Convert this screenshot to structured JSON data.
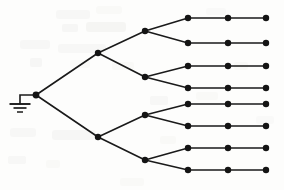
{
  "diagram": {
    "type": "node-link-tree",
    "width": 284,
    "height": 190,
    "background_color": "#fdfdfc",
    "stroke_color": "#1a1a1a",
    "node_fill_color": "#141414",
    "edge_width": 1.6,
    "node_radius": 3.2,
    "root_node_radius": 3.4,
    "ground_symbol": {
      "name": "earth-ground",
      "stem_from_x": 36,
      "stem_from_y": 95,
      "corner_x": 20,
      "corner_y": 95,
      "stem_x": 20,
      "stem_top_y": 95,
      "stem_bottom_y": 104,
      "bars": [
        {
          "half_width": 10.5,
          "y": 104,
          "thickness": 1.9
        },
        {
          "half_width": 6.5,
          "y": 108,
          "thickness": 1.7
        },
        {
          "half_width": 3.0,
          "y": 112,
          "thickness": 1.5
        }
      ]
    },
    "levels": [
      {
        "name": "root",
        "depth": 0,
        "x": 36,
        "count": 1
      },
      {
        "name": "level-1",
        "depth": 1,
        "x": 98,
        "count": 2
      },
      {
        "name": "level-2",
        "depth": 2,
        "x": 145,
        "count": 4
      },
      {
        "name": "leaf-a",
        "depth": 3,
        "x": 188,
        "count": 8
      },
      {
        "name": "leaf-b",
        "depth": 4,
        "x": 228,
        "count": 8
      },
      {
        "name": "leaf-c",
        "depth": 5,
        "x": 266,
        "count": 8
      }
    ],
    "nodes": [
      {
        "id": "root",
        "label": "root",
        "x": 36,
        "y": 95,
        "level": 0
      },
      {
        "id": "n1a",
        "label": "upper-branch",
        "x": 98,
        "y": 53,
        "level": 1
      },
      {
        "id": "n1b",
        "label": "lower-branch",
        "x": 98,
        "y": 137,
        "level": 1
      },
      {
        "id": "n2a",
        "label": "branch-1",
        "x": 145,
        "y": 31,
        "level": 2
      },
      {
        "id": "n2b",
        "label": "branch-2",
        "x": 145,
        "y": 77,
        "level": 2
      },
      {
        "id": "n2c",
        "label": "branch-3",
        "x": 145,
        "y": 115,
        "level": 2
      },
      {
        "id": "n2d",
        "label": "branch-4",
        "x": 145,
        "y": 160,
        "level": 2
      },
      {
        "id": "l1a",
        "label": "leaf-1-a",
        "x": 188,
        "y": 18,
        "level": 3
      },
      {
        "id": "l2a",
        "label": "leaf-2-a",
        "x": 188,
        "y": 43,
        "level": 3
      },
      {
        "id": "l3a",
        "label": "leaf-3-a",
        "x": 188,
        "y": 66,
        "level": 3
      },
      {
        "id": "l4a",
        "label": "leaf-4-a",
        "x": 188,
        "y": 88,
        "level": 3
      },
      {
        "id": "l5a",
        "label": "leaf-5-a",
        "x": 188,
        "y": 104,
        "level": 3
      },
      {
        "id": "l6a",
        "label": "leaf-6-a",
        "x": 188,
        "y": 126,
        "level": 3
      },
      {
        "id": "l7a",
        "label": "leaf-7-a",
        "x": 188,
        "y": 148,
        "level": 3
      },
      {
        "id": "l8a",
        "label": "leaf-8-a",
        "x": 188,
        "y": 170,
        "level": 3
      },
      {
        "id": "l1b",
        "label": "leaf-1-b",
        "x": 228,
        "y": 18,
        "level": 4
      },
      {
        "id": "l2b",
        "label": "leaf-2-b",
        "x": 228,
        "y": 43,
        "level": 4
      },
      {
        "id": "l3b",
        "label": "leaf-3-b",
        "x": 228,
        "y": 66,
        "level": 4
      },
      {
        "id": "l4b",
        "label": "leaf-4-b",
        "x": 228,
        "y": 88,
        "level": 4
      },
      {
        "id": "l5b",
        "label": "leaf-5-b",
        "x": 228,
        "y": 104,
        "level": 4
      },
      {
        "id": "l6b",
        "label": "leaf-6-b",
        "x": 228,
        "y": 126,
        "level": 4
      },
      {
        "id": "l7b",
        "label": "leaf-7-b",
        "x": 228,
        "y": 148,
        "level": 4
      },
      {
        "id": "l8b",
        "label": "leaf-8-b",
        "x": 228,
        "y": 170,
        "level": 4
      },
      {
        "id": "l1c",
        "label": "leaf-1-c",
        "x": 266,
        "y": 18,
        "level": 5
      },
      {
        "id": "l2c",
        "label": "leaf-2-c",
        "x": 266,
        "y": 43,
        "level": 5
      },
      {
        "id": "l3c",
        "label": "leaf-3-c",
        "x": 266,
        "y": 66,
        "level": 5
      },
      {
        "id": "l4c",
        "label": "leaf-4-c",
        "x": 266,
        "y": 88,
        "level": 5
      },
      {
        "id": "l5c",
        "label": "leaf-5-c",
        "x": 266,
        "y": 104,
        "level": 5
      },
      {
        "id": "l6c",
        "label": "leaf-6-c",
        "x": 266,
        "y": 126,
        "level": 5
      },
      {
        "id": "l7c",
        "label": "leaf-7-c",
        "x": 266,
        "y": 148,
        "level": 5
      },
      {
        "id": "l8c",
        "label": "leaf-8-c",
        "x": 266,
        "y": 170,
        "level": 5
      }
    ],
    "edges": [
      {
        "from": "root",
        "to": "n1a"
      },
      {
        "from": "root",
        "to": "n1b"
      },
      {
        "from": "n1a",
        "to": "n2a"
      },
      {
        "from": "n1a",
        "to": "n2b"
      },
      {
        "from": "n1b",
        "to": "n2c"
      },
      {
        "from": "n1b",
        "to": "n2d"
      },
      {
        "from": "n2a",
        "to": "l1a"
      },
      {
        "from": "n2a",
        "to": "l2a"
      },
      {
        "from": "n2b",
        "to": "l3a"
      },
      {
        "from": "n2b",
        "to": "l4a"
      },
      {
        "from": "n2c",
        "to": "l5a"
      },
      {
        "from": "n2c",
        "to": "l6a"
      },
      {
        "from": "n2d",
        "to": "l7a"
      },
      {
        "from": "n2d",
        "to": "l8a"
      },
      {
        "from": "l1a",
        "to": "l1b"
      },
      {
        "from": "l2a",
        "to": "l2b"
      },
      {
        "from": "l3a",
        "to": "l3b"
      },
      {
        "from": "l4a",
        "to": "l4b"
      },
      {
        "from": "l5a",
        "to": "l5b"
      },
      {
        "from": "l6a",
        "to": "l6b"
      },
      {
        "from": "l7a",
        "to": "l7b"
      },
      {
        "from": "l8a",
        "to": "l8b"
      },
      {
        "from": "l1b",
        "to": "l1c"
      },
      {
        "from": "l2b",
        "to": "l2c"
      },
      {
        "from": "l3b",
        "to": "l3c"
      },
      {
        "from": "l4b",
        "to": "l4c"
      },
      {
        "from": "l5b",
        "to": "l5c"
      },
      {
        "from": "l6b",
        "to": "l6c"
      },
      {
        "from": "l7b",
        "to": "l7c"
      },
      {
        "from": "l8b",
        "to": "l8c"
      }
    ],
    "scan_artifacts": [
      {
        "x": 56,
        "y": 10,
        "w": 34,
        "h": 9,
        "o": 0.05,
        "r": 3
      },
      {
        "x": 96,
        "y": 6,
        "w": 26,
        "h": 8,
        "o": 0.04,
        "r": 3
      },
      {
        "x": 62,
        "y": 24,
        "w": 16,
        "h": 8,
        "o": 0.06,
        "r": 2
      },
      {
        "x": 86,
        "y": 22,
        "w": 40,
        "h": 10,
        "o": 0.07,
        "r": 3
      },
      {
        "x": 20,
        "y": 40,
        "w": 30,
        "h": 9,
        "o": 0.05,
        "r": 3
      },
      {
        "x": 58,
        "y": 44,
        "w": 48,
        "h": 9,
        "o": 0.05,
        "r": 3
      },
      {
        "x": 30,
        "y": 58,
        "w": 12,
        "h": 9,
        "o": 0.06,
        "r": 2
      },
      {
        "x": 70,
        "y": 60,
        "w": 20,
        "h": 8,
        "o": 0.04,
        "r": 2
      },
      {
        "x": 112,
        "y": 62,
        "w": 22,
        "h": 8,
        "o": 0.04,
        "r": 2
      },
      {
        "x": 10,
        "y": 128,
        "w": 26,
        "h": 9,
        "o": 0.05,
        "r": 3
      },
      {
        "x": 52,
        "y": 130,
        "w": 44,
        "h": 10,
        "o": 0.06,
        "r": 3
      },
      {
        "x": 8,
        "y": 156,
        "w": 18,
        "h": 8,
        "o": 0.05,
        "r": 2
      },
      {
        "x": 46,
        "y": 160,
        "w": 14,
        "h": 8,
        "o": 0.04,
        "r": 2
      },
      {
        "x": 150,
        "y": 96,
        "w": 18,
        "h": 9,
        "o": 0.05,
        "r": 2
      },
      {
        "x": 196,
        "y": 92,
        "w": 22,
        "h": 8,
        "o": 0.04,
        "r": 2
      },
      {
        "x": 160,
        "y": 136,
        "w": 16,
        "h": 8,
        "o": 0.04,
        "r": 2
      },
      {
        "x": 234,
        "y": 62,
        "w": 14,
        "h": 8,
        "o": 0.04,
        "r": 2
      },
      {
        "x": 206,
        "y": 8,
        "w": 20,
        "h": 7,
        "o": 0.03,
        "r": 2
      },
      {
        "x": 256,
        "y": 116,
        "w": 18,
        "h": 8,
        "o": 0.03,
        "r": 2
      },
      {
        "x": 120,
        "y": 178,
        "w": 24,
        "h": 8,
        "o": 0.04,
        "r": 2
      }
    ]
  }
}
